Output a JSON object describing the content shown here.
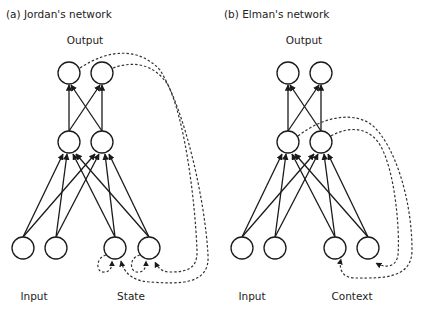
{
  "panels": [
    {
      "caption": "(a) Jordan's network",
      "output_label": "Output",
      "bottom_labels": [
        "Input",
        "State"
      ]
    },
    {
      "caption": "(b) Elman's network",
      "output_label": "Output",
      "bottom_labels": [
        "Input",
        "Context"
      ]
    }
  ],
  "colors": {
    "stroke": "#1a1a1a",
    "dashed": "#333333",
    "background": "#ffffff"
  }
}
